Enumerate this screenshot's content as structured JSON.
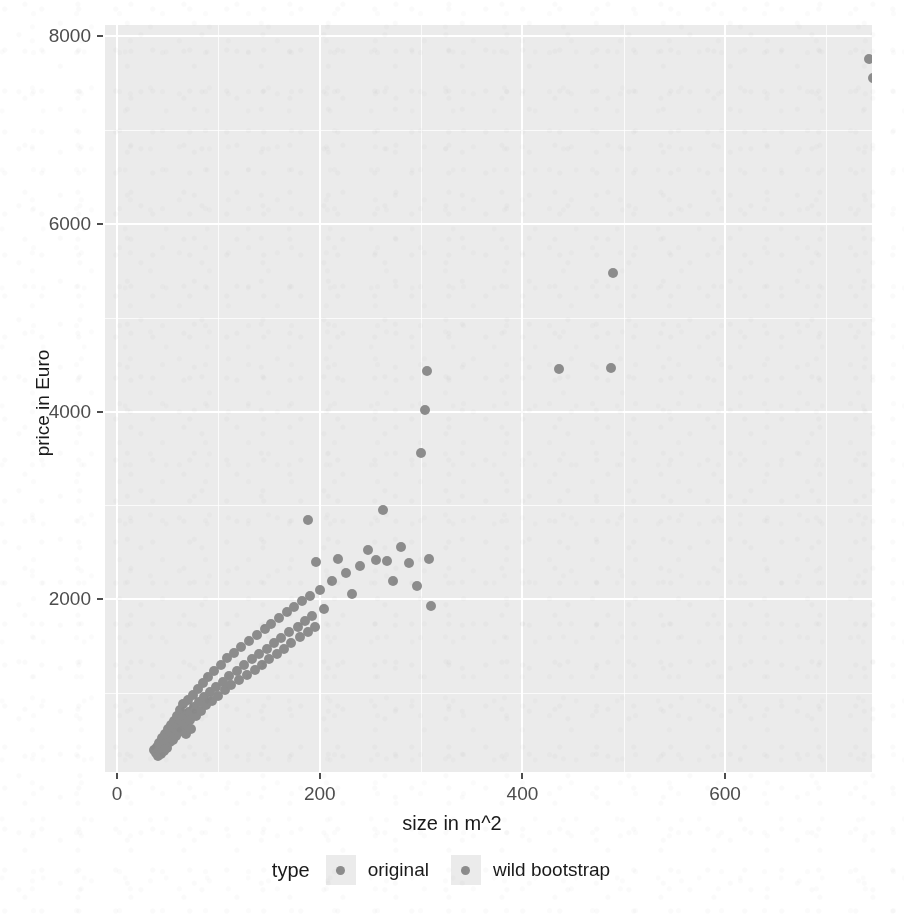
{
  "figure": {
    "background_color": "#ffffff",
    "panel_color": "#ebebeb",
    "gridline_color": "#ffffff",
    "point_color": "#8c8c8c",
    "cropped_header_text": ""
  },
  "chart_data": {
    "type": "scatter",
    "title": "",
    "xlabel": "size in m^2",
    "ylabel": "price in Euro",
    "xlim": [
      -12,
      745
    ],
    "ylim": [
      160,
      8120
    ],
    "xticks": [
      0,
      200,
      400,
      600
    ],
    "yticks": [
      2000,
      4000,
      6000,
      8000
    ],
    "xtick_labels": [
      "0",
      "200",
      "400",
      "600"
    ],
    "ytick_labels": [
      "2000",
      "4000",
      "6000",
      "8000"
    ],
    "x_minor_ticks": [
      100,
      300,
      500,
      700
    ],
    "y_minor_ticks": [
      1000,
      3000,
      5000,
      7000
    ],
    "grid": true,
    "legend": {
      "title": "type",
      "position": "bottom",
      "entries": [
        {
          "label": "original",
          "color": "#8c8c8c"
        },
        {
          "label": "wild bootstrap",
          "color": "#8c8c8c"
        }
      ]
    },
    "series": [
      {
        "name": "original",
        "color": "#8c8c8c",
        "points": [
          [
            36,
            390
          ],
          [
            38,
            360
          ],
          [
            39,
            430
          ],
          [
            40,
            330
          ],
          [
            41,
            470
          ],
          [
            42,
            395
          ],
          [
            43,
            350
          ],
          [
            44,
            520
          ],
          [
            45,
            440
          ],
          [
            46,
            380
          ],
          [
            47,
            560
          ],
          [
            48,
            470
          ],
          [
            49,
            420
          ],
          [
            50,
            620
          ],
          [
            51,
            530
          ],
          [
            52,
            480
          ],
          [
            53,
            660
          ],
          [
            54,
            575
          ],
          [
            55,
            505
          ],
          [
            56,
            700
          ],
          [
            57,
            615
          ],
          [
            58,
            545
          ],
          [
            59,
            760
          ],
          [
            60,
            650
          ],
          [
            61,
            585
          ],
          [
            62,
            820
          ],
          [
            63,
            700
          ],
          [
            64,
            630
          ],
          [
            65,
            880
          ],
          [
            66,
            745
          ],
          [
            67,
            672
          ],
          [
            68,
            560
          ],
          [
            70,
            930
          ],
          [
            71,
            800
          ],
          [
            72,
            715
          ],
          [
            73,
            620
          ],
          [
            75,
            985
          ],
          [
            76,
            855
          ],
          [
            78,
            760
          ],
          [
            80,
            1045
          ],
          [
            81,
            905
          ],
          [
            83,
            815
          ],
          [
            85,
            1110
          ],
          [
            86,
            960
          ],
          [
            88,
            870
          ],
          [
            90,
            1175
          ],
          [
            92,
            1015
          ],
          [
            94,
            920
          ],
          [
            96,
            1240
          ],
          [
            98,
            1070
          ],
          [
            100,
            975
          ],
          [
            102,
            1300
          ],
          [
            104,
            1120
          ],
          [
            106,
            1030
          ],
          [
            108,
            1370
          ],
          [
            110,
            1180
          ],
          [
            112,
            1085
          ],
          [
            115,
            1430
          ],
          [
            118,
            1240
          ],
          [
            120,
            1140
          ],
          [
            122,
            1490
          ],
          [
            125,
            1300
          ],
          [
            128,
            1195
          ],
          [
            130,
            1560
          ],
          [
            133,
            1360
          ],
          [
            136,
            1250
          ],
          [
            138,
            1620
          ],
          [
            140,
            1415
          ],
          [
            143,
            1305
          ],
          [
            146,
            1680
          ],
          [
            148,
            1475
          ],
          [
            150,
            1360
          ],
          [
            152,
            1740
          ],
          [
            155,
            1530
          ],
          [
            158,
            1420
          ],
          [
            160,
            1800
          ],
          [
            162,
            1590
          ],
          [
            165,
            1475
          ],
          [
            168,
            1860
          ],
          [
            170,
            1650
          ],
          [
            172,
            1535
          ],
          [
            175,
            1920
          ],
          [
            178,
            1705
          ],
          [
            180,
            1595
          ],
          [
            182,
            1980
          ],
          [
            185,
            1765
          ],
          [
            188,
            1650
          ],
          [
            190,
            2040
          ],
          [
            192,
            1825
          ],
          [
            195,
            1710
          ]
        ]
      },
      {
        "name": "wild bootstrap",
        "color": "#8c8c8c",
        "points": [
          [
            188,
            2840
          ],
          [
            196,
            2400
          ],
          [
            200,
            2100
          ],
          [
            204,
            1900
          ],
          [
            212,
            2200
          ],
          [
            218,
            2430
          ],
          [
            226,
            2280
          ],
          [
            232,
            2060
          ],
          [
            240,
            2350
          ],
          [
            248,
            2530
          ],
          [
            255,
            2420
          ],
          [
            262,
            2950
          ],
          [
            266,
            2410
          ],
          [
            272,
            2190
          ],
          [
            280,
            2560
          ],
          [
            288,
            2390
          ],
          [
            296,
            2140
          ],
          [
            300,
            3560
          ],
          [
            304,
            4020
          ],
          [
            306,
            4430
          ],
          [
            308,
            2430
          ],
          [
            310,
            1930
          ],
          [
            436,
            4450
          ],
          [
            487,
            4460
          ],
          [
            489,
            5480
          ],
          [
            742,
            7760
          ],
          [
            746,
            7560
          ]
        ]
      }
    ]
  }
}
